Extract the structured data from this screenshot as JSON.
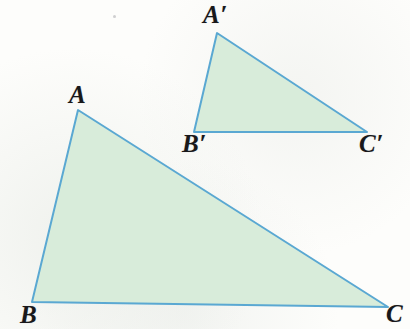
{
  "figure": {
    "background_color": "#fdfdfb",
    "fill_color": "#d8ecda",
    "stroke_color": "#5aa8d2",
    "stroke_width": 2,
    "label_color": "#18181a",
    "canvas": {
      "width": 410,
      "height": 329
    }
  },
  "shapes": [
    {
      "name": "triangle-abc",
      "role": "large-triangle",
      "points": "78,110 32,302 388,307",
      "vertices": [
        {
          "label": "A",
          "x": 78,
          "y": 110
        },
        {
          "label": "B",
          "x": 32,
          "y": 302
        },
        {
          "label": "C",
          "x": 388,
          "y": 307
        }
      ]
    },
    {
      "name": "triangle-a-prime-b-prime-c-prime",
      "role": "small-triangle",
      "points": "217,33 194,132 367,132",
      "vertices": [
        {
          "label": "A′",
          "x": 217,
          "y": 33
        },
        {
          "label": "B′",
          "x": 194,
          "y": 132
        },
        {
          "label": "C′",
          "x": 367,
          "y": 132
        }
      ]
    }
  ],
  "labels": {
    "a": {
      "text": "A",
      "left": 69,
      "top": 82
    },
    "b": {
      "text": "B",
      "left": 20,
      "top": 302
    },
    "c": {
      "text": "C",
      "left": 386,
      "top": 301
    },
    "a_prime": {
      "text": "A′",
      "left": 203,
      "top": 2
    },
    "b_prime": {
      "text": "B′",
      "left": 182,
      "top": 131
    },
    "c_prime": {
      "text": "C′",
      "left": 359,
      "top": 131
    }
  }
}
